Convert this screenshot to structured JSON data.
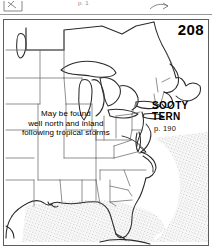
{
  "page": {
    "panel_number": "208",
    "previous_panel_caption": "p. 1"
  },
  "species": {
    "name_line1": "SOOTY",
    "name_line2": "TERN",
    "page_reference": "p. 190"
  },
  "annotation": {
    "line1": "May be found",
    "line2": "well north and inland",
    "line3": "following tropical storms"
  },
  "map": {
    "region": "eastern-united-states",
    "range_band_label": "offshore-pelagic-range",
    "colors": {
      "ink": "#222222",
      "state_border": "#6b6b6b",
      "frame": "#5d5d5d",
      "range_fill": "#d9d9d9",
      "paper": "#ffffff"
    }
  }
}
